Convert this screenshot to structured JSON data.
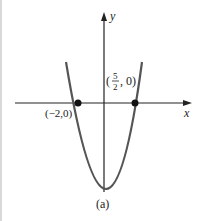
{
  "figure": {
    "caption": "(a)",
    "axes": {
      "x_label": "x",
      "y_label": "y"
    },
    "points": [
      {
        "label": "(−2,0)",
        "x": -2,
        "y": 0
      },
      {
        "label_prefix": "(",
        "frac_num": "5",
        "frac_den": "2",
        "label_suffix": ", 0)",
        "x": 2.5,
        "y": 0
      }
    ],
    "curve": {
      "type": "parabola",
      "opens": "up",
      "roots": [
        -2,
        2.5
      ],
      "color": "#555555"
    }
  }
}
